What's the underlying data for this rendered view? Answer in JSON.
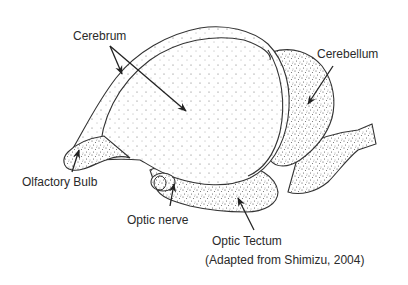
{
  "figure": {
    "labels": {
      "cerebrum": "Cerebrum",
      "cerebellum": "Cerebellum",
      "olfactory_bulb": "Olfactory Bulb",
      "optic_nerve": "Optic nerve",
      "optic_tectum": "Optic Tectum"
    },
    "caption": "(Adapted from Shimizu, 2004)"
  }
}
